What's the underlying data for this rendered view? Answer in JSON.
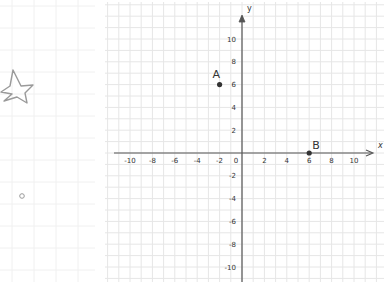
{
  "diagram": {
    "type": "coordinate-plane",
    "axes": {
      "x_label": "x",
      "y_label": "y",
      "x_range": [
        -10,
        10
      ],
      "y_range": [
        -10,
        10
      ],
      "tick_step": 2,
      "origin_label": "0",
      "x_ticks": [
        "-10",
        "-8",
        "-6",
        "-4",
        "-2",
        "2",
        "4",
        "6",
        "8",
        "10"
      ],
      "y_ticks": [
        "10",
        "8",
        "6",
        "4",
        "2",
        "-2",
        "-4",
        "-6",
        "-8",
        "-10"
      ]
    },
    "points": [
      {
        "label": "A",
        "x": -2,
        "y": 6
      },
      {
        "label": "B",
        "x": 6,
        "y": 0
      }
    ],
    "decorations": [
      {
        "name": "star-doodle"
      },
      {
        "name": "small-circle-doodle"
      }
    ],
    "colors": {
      "axis": "#555555",
      "grid": "#e6e6e6",
      "point": "#333333",
      "text": "#333333",
      "doodle": "#9a9a9a"
    }
  }
}
